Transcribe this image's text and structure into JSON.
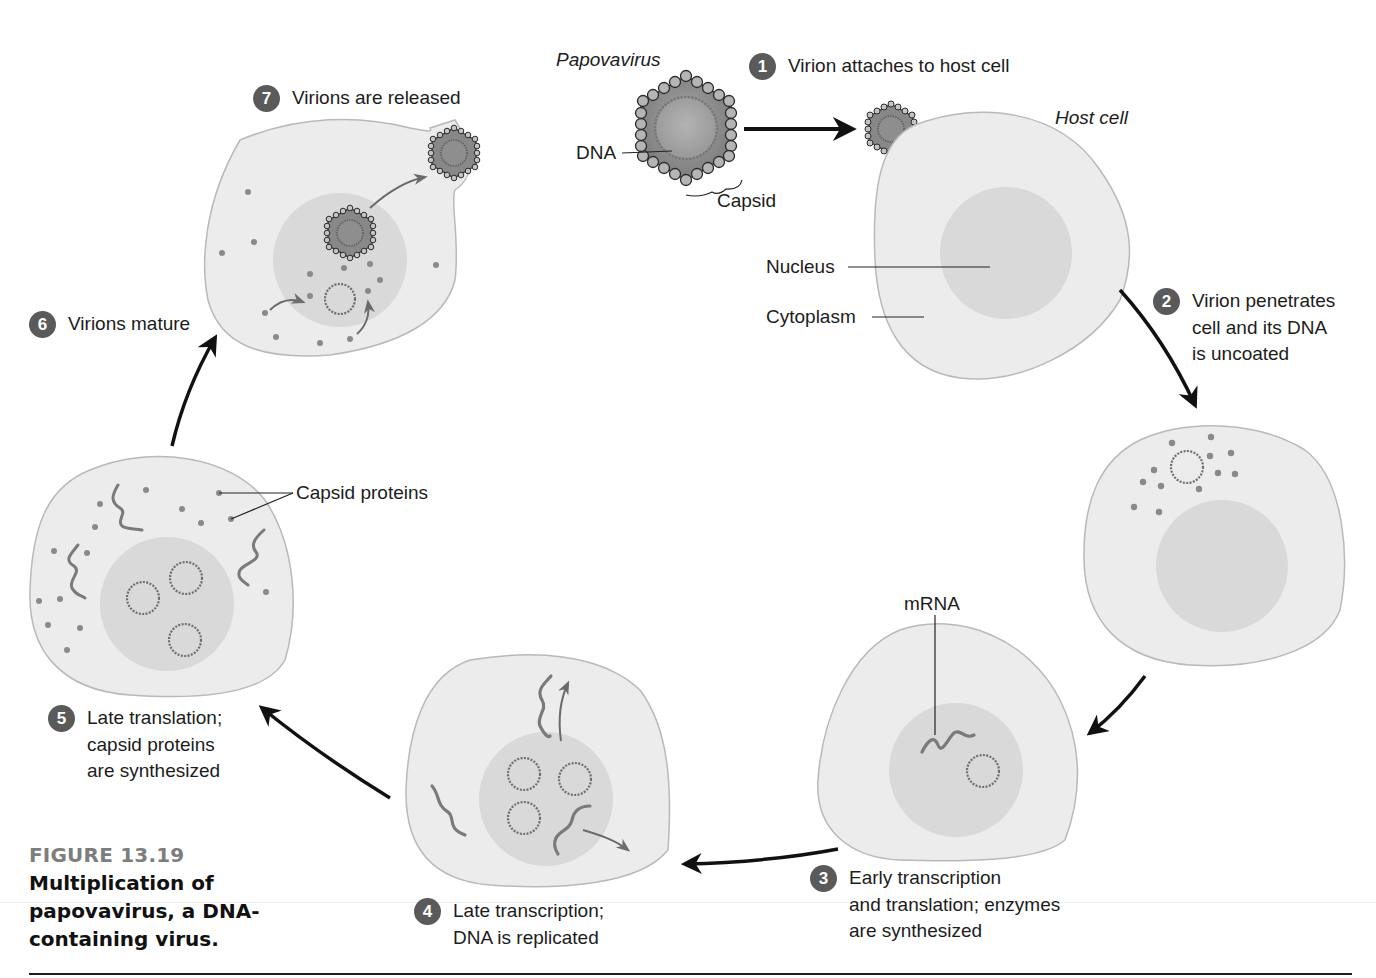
{
  "figure": {
    "number": "FIGURE 13.19",
    "title_lines": [
      "Multiplication of",
      "papovavirus, a DNA-",
      "containing virus."
    ]
  },
  "labels": {
    "papovavirus": "Papovavirus",
    "dna": "DNA",
    "capsid": "Capsid",
    "host_cell": "Host cell",
    "nucleus": "Nucleus",
    "cytoplasm": "Cytoplasm",
    "mrna": "mRNA",
    "capsid_proteins": "Capsid proteins"
  },
  "steps": [
    {
      "number": "1",
      "lines": [
        "Virion attaches to host cell"
      ]
    },
    {
      "number": "2",
      "lines": [
        "Virion penetrates",
        "cell and its DNA",
        "is uncoated"
      ]
    },
    {
      "number": "3",
      "lines": [
        "Early transcription",
        "and translation; enzymes",
        "are synthesized"
      ]
    },
    {
      "number": "4",
      "lines": [
        "Late transcription;",
        "DNA is replicated"
      ]
    },
    {
      "number": "5",
      "lines": [
        "Late translation;",
        "capsid proteins",
        "are synthesized"
      ]
    },
    {
      "number": "6",
      "lines": [
        "Virions mature"
      ]
    },
    {
      "number": "7",
      "lines": [
        "Virions are released"
      ]
    }
  ],
  "colors": {
    "cell_fill": "#ececec",
    "cell_stroke": "#b9b9b9",
    "nucleus_fill": "#d9d9d9",
    "badge": "#5a5a5a",
    "capsid_bead": "#9a9a9a",
    "dna_ring": "#6e6e6e",
    "arrow": "#111111",
    "caption_number": "#7d7d7d"
  }
}
